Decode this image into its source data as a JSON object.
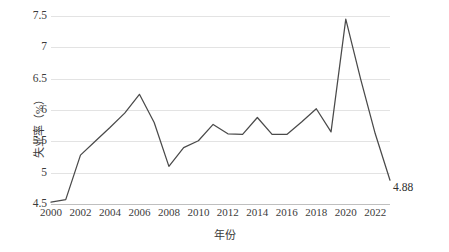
{
  "chart_data": {
    "type": "line",
    "title": "",
    "xlabel": "年份",
    "ylabel": "失业率（%）",
    "xlim": [
      2000,
      2023
    ],
    "ylim": [
      4.5,
      7.5
    ],
    "grid": true,
    "legend": "none",
    "x": [
      2000,
      2001,
      2002,
      2003,
      2004,
      2005,
      2006,
      2007,
      2008,
      2009,
      2010,
      2011,
      2012,
      2013,
      2014,
      2015,
      2016,
      2017,
      2018,
      2019,
      2020,
      2021,
      2022,
      2023
    ],
    "values": [
      4.53,
      4.57,
      5.28,
      5.5,
      5.72,
      5.95,
      6.25,
      5.8,
      5.1,
      5.4,
      5.51,
      5.77,
      5.62,
      5.61,
      5.88,
      5.61,
      5.61,
      5.81,
      6.02,
      5.65,
      7.45,
      6.5,
      5.62,
      4.88
    ],
    "y_ticks": [
      "4.5",
      "5",
      "5.5",
      "6",
      "6.5",
      "7",
      "7.5"
    ],
    "y_tick_values": [
      4.5,
      5,
      5.5,
      6,
      6.5,
      7,
      7.5
    ],
    "x_ticks": [
      "2000",
      "2002",
      "2004",
      "2006",
      "2008",
      "2010",
      "2012",
      "2014",
      "2016",
      "2018",
      "2020",
      "2022"
    ],
    "x_tick_values": [
      2000,
      2002,
      2004,
      2006,
      2008,
      2010,
      2012,
      2014,
      2016,
      2018,
      2020,
      2022
    ],
    "annotations": [
      {
        "text": "4.88",
        "x": 2023,
        "y": 4.88
      }
    ],
    "series_color": "#4a4a4a",
    "grid_color": "#e3e3e3"
  },
  "bottom_caption": ""
}
